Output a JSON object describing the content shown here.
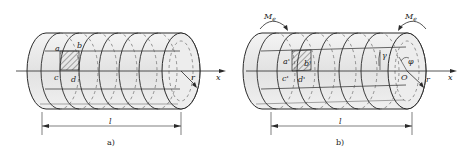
{
  "figure_a": {
    "caption": "a)",
    "points": {
      "a": "a",
      "b": "b",
      "c": "c",
      "d": "d"
    },
    "axis_label": "x",
    "radius_label": "r",
    "length_label": "l"
  },
  "figure_b": {
    "caption": "b)",
    "points": {
      "a": "a'",
      "b": "b'",
      "c": "c'",
      "d": "d'"
    },
    "axis_label": "x",
    "radius_label": "r",
    "length_label": "l",
    "moment_left": "M",
    "moment_left_sub": "e",
    "moment_right": "M",
    "moment_right_sub": "e",
    "gamma_label": "γ",
    "phi_label": "φ",
    "center_label": "O"
  },
  "colors": {
    "body": "#ececec",
    "line": "#2a2a2a",
    "dash": "#555555"
  }
}
